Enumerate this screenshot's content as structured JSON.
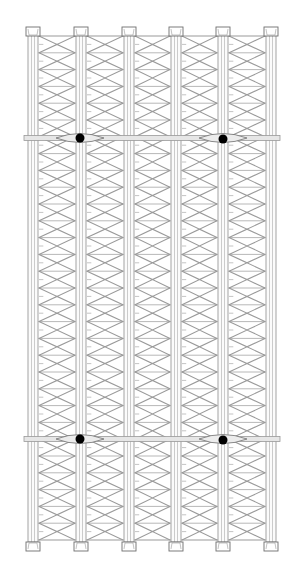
{
  "drawing": {
    "title": "Braced column elevation with tie bands",
    "width": 299,
    "height": 579,
    "colors": {
      "background": "#ffffff",
      "line": "#9a9a9a",
      "line_dark": "#6e6e6e",
      "band_fill": "#e6e6e6",
      "node": "#000000"
    },
    "columns_x": [
      33,
      81,
      129,
      176,
      223,
      271
    ],
    "column_width": 10,
    "frame": {
      "top": 36,
      "bottom": 540,
      "left": 28,
      "right": 276
    },
    "bays": 30,
    "caps": {
      "width": 14,
      "height": 9,
      "top_y": 27,
      "bottom_y": 542
    },
    "bands": [
      {
        "y": 138,
        "nodes": [
          {
            "x": 80,
            "y": 138
          },
          {
            "x": 223,
            "y": 139
          }
        ]
      },
      {
        "y": 439,
        "nodes": [
          {
            "x": 80,
            "y": 439
          },
          {
            "x": 223,
            "y": 440
          }
        ]
      }
    ],
    "band_height": 5,
    "node_radius": 4.5,
    "band_extent": {
      "left": 24,
      "right": 280
    }
  }
}
